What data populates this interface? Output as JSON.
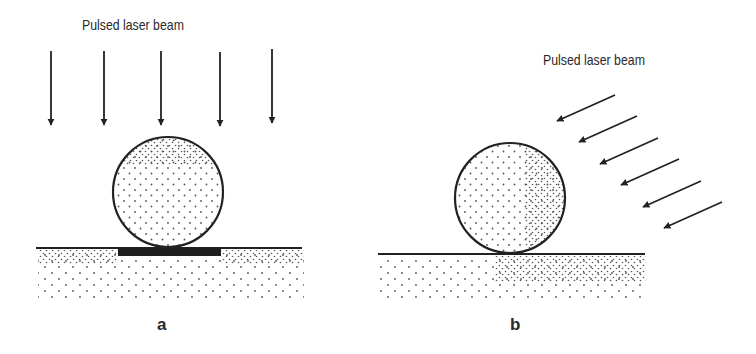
{
  "figure": {
    "panels": [
      {
        "id": "a",
        "label": "a",
        "beam_label": "Pulsed laser beam",
        "beam_direction": "vertical (normal incidence)",
        "arrow_count": 5,
        "features": [
          "spherical particle",
          "substrate",
          "dark absorbing layer beneath particle"
        ]
      },
      {
        "id": "b",
        "label": "b",
        "beam_label": "Pulsed laser beam",
        "beam_direction": "oblique (from upper right)",
        "arrow_count": 6,
        "features": [
          "spherical particle with denser dotted right side",
          "substrate with denser dotted right region"
        ]
      }
    ],
    "colors": {
      "line": "#222222",
      "dots": "#555555",
      "absorber": "#1e1e1e",
      "background": "#ffffff"
    }
  }
}
